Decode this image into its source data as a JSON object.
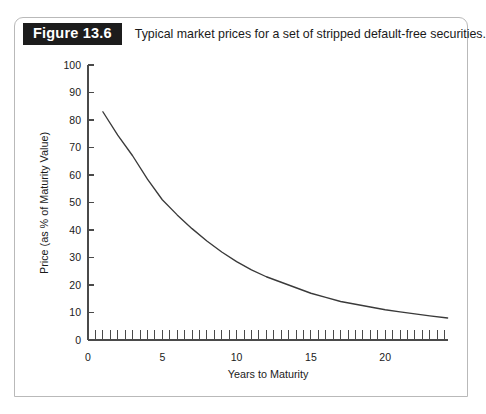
{
  "figure": {
    "badge": "Figure 13.6",
    "caption": "Typical market prices for a set of stripped default-free securities."
  },
  "colors": {
    "badge_background": "#1c1c1c",
    "badge_text": "#ffffff",
    "frame_border": "#b9b9b9",
    "axis": "#4a4a4a",
    "curve": "#3a3a3a",
    "page_background": "#ffffff"
  },
  "chart_data": {
    "type": "line",
    "title": "Typical market prices for a set of stripped default-free securities.",
    "xlabel": "Years to Maturity",
    "ylabel": "Price (as % of Maturity Value)",
    "xlim": [
      0,
      24.2
    ],
    "ylim": [
      0,
      100
    ],
    "xticks": [
      0,
      5,
      10,
      15,
      20
    ],
    "xtick_labels": [
      "0",
      "5",
      "10",
      "15",
      "20"
    ],
    "yticks": [
      0,
      10,
      20,
      30,
      40,
      50,
      60,
      70,
      80,
      90,
      100
    ],
    "ytick_labels": [
      "0",
      "10",
      "20",
      "30",
      "40",
      "50",
      "60",
      "70",
      "80",
      "90",
      "100"
    ],
    "x_minor_tick_interval": 0.5,
    "grid": false,
    "legend": null,
    "series": [
      {
        "name": "Stripped security price",
        "x": [
          1,
          2,
          3,
          4,
          5,
          6,
          7,
          8,
          9,
          10,
          11,
          12,
          13,
          14,
          15,
          16,
          17,
          18,
          19,
          20,
          21,
          22,
          23,
          24.2
        ],
        "values": [
          83.0,
          74.5,
          67.0,
          58.5,
          51.0,
          45.5,
          40.5,
          36.0,
          32.0,
          28.5,
          25.5,
          23.0,
          21.0,
          19.0,
          17.0,
          15.5,
          14.0,
          13.0,
          12.0,
          11.0,
          10.2,
          9.5,
          8.8,
          8.0
        ]
      }
    ]
  }
}
